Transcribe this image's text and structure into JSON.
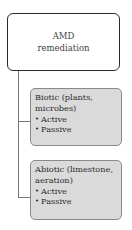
{
  "root": {
    "lines": [
      "AMD",
      "remediation"
    ]
  },
  "children": [
    {
      "title_lines": [
        "Biotic (plants,",
        "microbes)"
      ],
      "bullets": [
        "Active",
        "Passive"
      ]
    },
    {
      "title_lines": [
        "Abiotic (limestone,",
        "aeration)"
      ],
      "bullets": [
        "Active",
        "Passive"
      ]
    }
  ],
  "bullet_glyph": "•",
  "colors": {
    "root_fill": "#ffffff",
    "root_border": "#2a2a2a",
    "child_fill": "#dadada",
    "child_border": "#8a8a8a",
    "connector": "#777777"
  }
}
